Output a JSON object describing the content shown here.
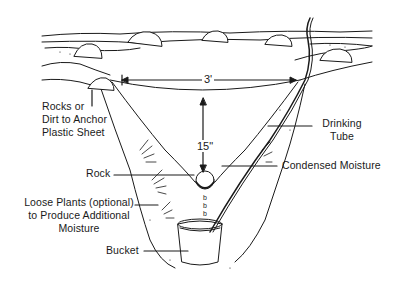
{
  "diagram": {
    "labels": {
      "rocks_anchor": [
        "Rocks or",
        "Dirt to Anchor",
        "Plastic Sheet"
      ],
      "drinking_tube": [
        "Drinking",
        "Tube"
      ],
      "rock": "Rock",
      "condensed_moisture": "Condensed Moisture",
      "loose_plants": [
        "Loose Plants (optional)",
        "to Produce Additional",
        "Moisture"
      ],
      "bucket": "Bucket"
    },
    "dimensions": {
      "width": "3'",
      "depth": "15\""
    },
    "colors": {
      "ink": "#1a1a1a",
      "background": "#ffffff"
    }
  }
}
